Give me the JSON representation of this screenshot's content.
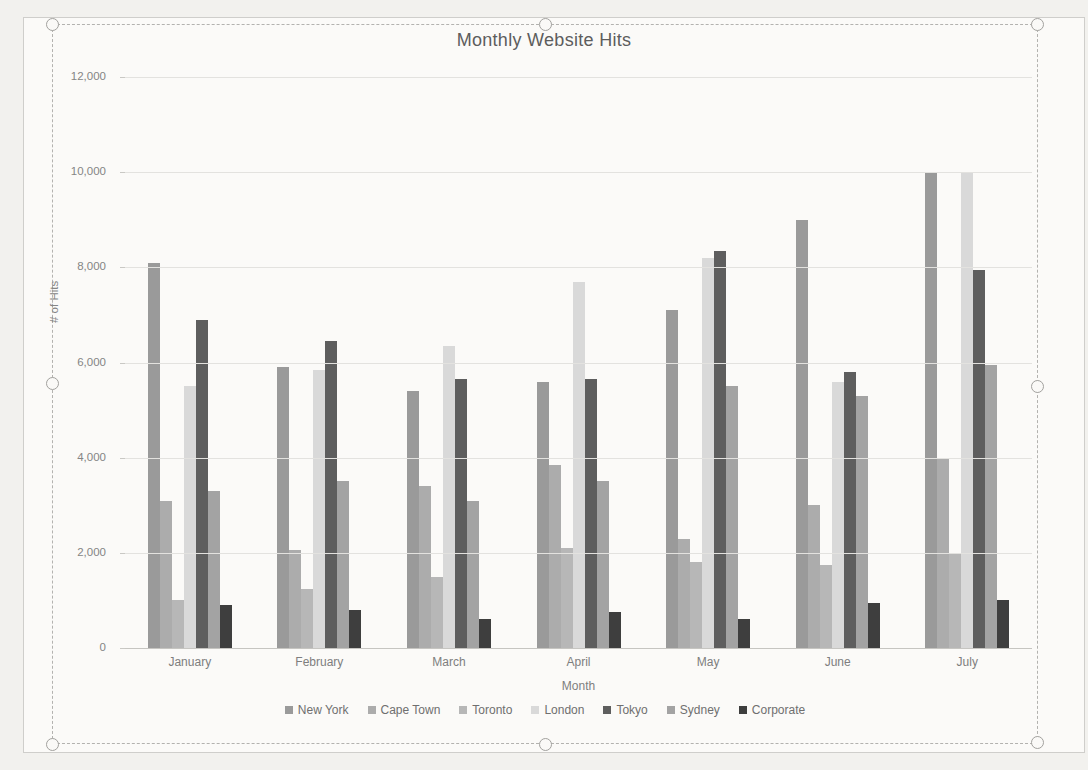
{
  "window": {
    "background": "#f2f1ee",
    "selection": "chart-object-selected"
  },
  "chart": {
    "title": "Monthly Website Hits",
    "y_axis": {
      "title": "# of Hits",
      "ticks": [
        "12,000",
        "10,000",
        "8,000",
        "6,000",
        "4,000",
        "2,000",
        "0"
      ]
    },
    "x_axis": {
      "title": "Month"
    }
  },
  "chart_data": {
    "type": "bar",
    "title": "Monthly Website Hits",
    "xlabel": "Month",
    "ylabel": "# of Hits",
    "ylim": [
      0,
      12000
    ],
    "y_tick_step": 2000,
    "grid": true,
    "legend_position": "bottom",
    "categories": [
      "January",
      "February",
      "March",
      "April",
      "May",
      "June",
      "July"
    ],
    "series": [
      {
        "name": "New York",
        "color": "#9a9a9a",
        "values": [
          8100,
          5900,
          5400,
          5600,
          7100,
          9000,
          10000
        ]
      },
      {
        "name": "Cape Town",
        "color": "#acacac",
        "values": [
          3100,
          2050,
          3400,
          3850,
          2300,
          3000,
          4000
        ]
      },
      {
        "name": "Toronto",
        "color": "#b7b7b7",
        "values": [
          1000,
          1250,
          1500,
          2100,
          1800,
          1750,
          2000
        ]
      },
      {
        "name": "London",
        "color": "#d9d9d9",
        "values": [
          5500,
          5850,
          6350,
          7700,
          8200,
          5600,
          10000
        ]
      },
      {
        "name": "Tokyo",
        "color": "#5e5e5e",
        "values": [
          6900,
          6450,
          5650,
          5650,
          8350,
          5800,
          7950
        ]
      },
      {
        "name": "Sydney",
        "color": "#a3a3a3",
        "values": [
          3300,
          3500,
          3100,
          3500,
          5500,
          5300,
          5950
        ]
      },
      {
        "name": "Corporate",
        "color": "#3e3e3e",
        "values": [
          900,
          800,
          600,
          750,
          600,
          950,
          1000
        ]
      }
    ]
  }
}
